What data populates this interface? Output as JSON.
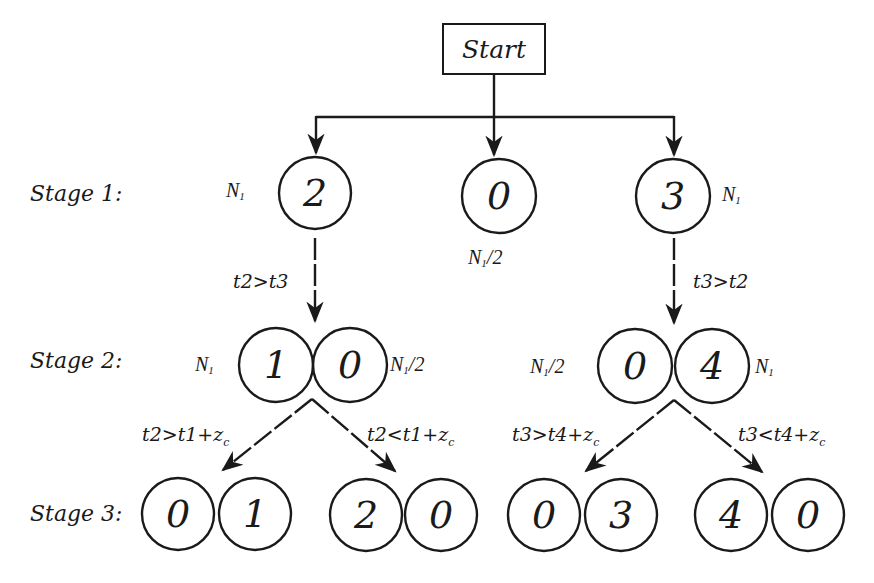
{
  "diagram": {
    "start_label": "Start",
    "stages": [
      {
        "label": "Stage 1:"
      },
      {
        "label": "Stage 2:"
      },
      {
        "label": "Stage 3:"
      }
    ],
    "stage1": {
      "nodes": [
        {
          "value": "2",
          "annotation": "N",
          "annotation_sub": "1"
        },
        {
          "value": "0",
          "annotation": "N",
          "annotation_sub": "1",
          "annotation_suffix": "/2"
        },
        {
          "value": "3",
          "annotation": "N",
          "annotation_sub": "1"
        }
      ],
      "edges": [
        {
          "from": "Start",
          "to": "2",
          "style": "solid"
        },
        {
          "from": "Start",
          "to": "0",
          "style": "solid"
        },
        {
          "from": "Start",
          "to": "3",
          "style": "solid"
        }
      ]
    },
    "stage1_to_2": {
      "left_condition": "t2>t3",
      "right_condition": "t3>t2"
    },
    "stage2": {
      "left_pair": [
        {
          "value": "1",
          "annotation": "N",
          "annotation_sub": "1"
        },
        {
          "value": "0",
          "annotation": "N",
          "annotation_sub": "1",
          "annotation_suffix": "/2"
        }
      ],
      "right_pair": [
        {
          "value": "0",
          "annotation": "N",
          "annotation_sub": "1",
          "annotation_suffix": "/2"
        },
        {
          "value": "4",
          "annotation": "N",
          "annotation_sub": "1"
        }
      ]
    },
    "stage2_to_3": {
      "left_pair_conditions": {
        "left": {
          "text": "t2>t1+z",
          "sub": "c"
        },
        "right": {
          "text": "t2<t1+z",
          "sub": "c"
        }
      },
      "right_pair_conditions": {
        "left": {
          "text": "t3>t4+z",
          "sub": "c"
        },
        "right": {
          "text": "t3<t4+z",
          "sub": "c"
        }
      }
    },
    "stage3": {
      "pairs": [
        [
          "0",
          "1"
        ],
        [
          "2",
          "0"
        ],
        [
          "0",
          "3"
        ],
        [
          "4",
          "0"
        ]
      ]
    },
    "colors": {
      "stroke": "#1a1a1a",
      "background": "#ffffff"
    }
  }
}
